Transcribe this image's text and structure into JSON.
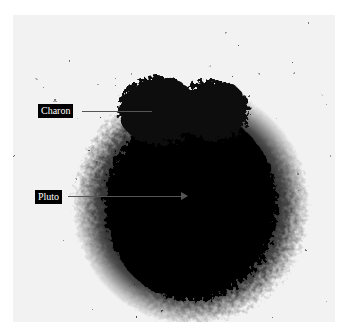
{
  "figure": {
    "labels": [
      {
        "text": "Charon",
        "target": "bump on upper-left edge of blob"
      },
      {
        "text": "Pluto",
        "target": "center of dark blob"
      }
    ],
    "colors": {
      "background": "#f2f2f2",
      "blob": "#0a0a0a",
      "label_bg": "#000000",
      "label_text": "#ffffff"
    }
  }
}
